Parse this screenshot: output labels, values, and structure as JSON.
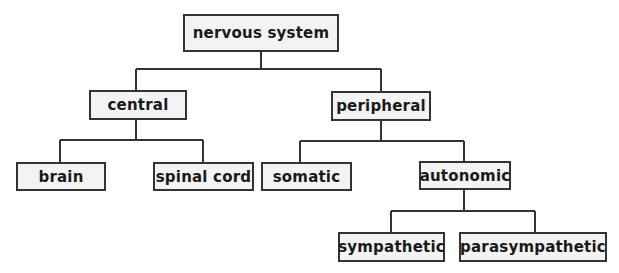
{
  "diagram": {
    "type": "tree",
    "colors": {
      "line": "#333333",
      "box_fill": "#f3f3f3",
      "text": "#1a1a1a",
      "background": "#ffffff"
    },
    "nodes": {
      "nervous_system": {
        "label": "nervous system",
        "parent": null
      },
      "central": {
        "label": "central",
        "parent": "nervous_system"
      },
      "peripheral": {
        "label": "peripheral",
        "parent": "nervous_system"
      },
      "brain": {
        "label": "brain",
        "parent": "central"
      },
      "spinal_cord": {
        "label": "spinal cord",
        "parent": "central"
      },
      "somatic": {
        "label": "somatic",
        "parent": "peripheral"
      },
      "autonomic": {
        "label": "autonomic",
        "parent": "peripheral"
      },
      "sympathetic": {
        "label": "sympathetic",
        "parent": "autonomic"
      },
      "parasympathetic": {
        "label": "parasympathetic",
        "parent": "autonomic"
      }
    }
  }
}
